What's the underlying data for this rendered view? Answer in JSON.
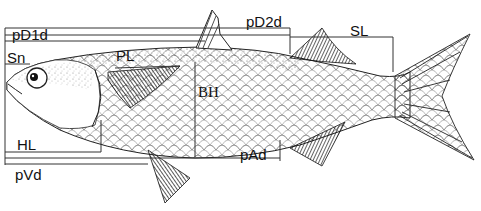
{
  "diagram": {
    "colors": {
      "ink": "#111111",
      "line": "#333333",
      "background": "#ffffff"
    },
    "labels": {
      "pD1d": "pD1d",
      "pD2d": "pD2d",
      "SL": "SL",
      "Sn": "Sn",
      "PL": "PL",
      "BH": "BH",
      "HL": "HL",
      "pAd": "pAd",
      "pVd": "pVd"
    }
  }
}
